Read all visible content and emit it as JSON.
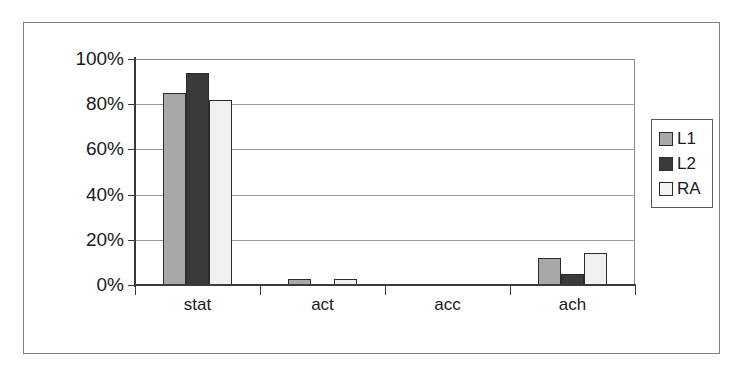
{
  "chart_data": {
    "type": "bar",
    "title": "",
    "subtitle": "",
    "xlabel": "",
    "ylabel": "",
    "categories": [
      "stat",
      "act",
      "acc",
      "ach"
    ],
    "series": [
      {
        "name": "L1",
        "color": "#a8a8a8",
        "values": [
          85,
          2.5,
          0,
          12
        ]
      },
      {
        "name": "L2",
        "color": "#3a3a3a",
        "values": [
          94,
          0,
          0,
          5
        ]
      },
      {
        "name": "RA",
        "color": "#f0f0f0",
        "values": [
          82,
          2.5,
          0,
          14
        ]
      }
    ],
    "ylim": [
      0,
      100
    ],
    "ytick_labels": [
      "100%",
      "80%",
      "60%",
      "40%",
      "20%",
      "0%"
    ],
    "ytick_values": [
      100,
      80,
      60,
      40,
      20,
      0
    ],
    "grid": true,
    "legend_position": "right",
    "value_suffix": "%"
  },
  "legend": {
    "entries": [
      {
        "label": "L1"
      },
      {
        "label": "L2"
      },
      {
        "label": "RA"
      }
    ]
  }
}
